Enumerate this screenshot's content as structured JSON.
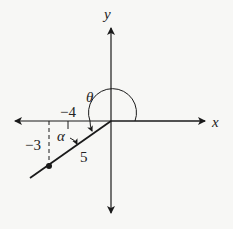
{
  "diagram": {
    "axes": {
      "x_label": "x",
      "y_label": "y"
    },
    "labels": {
      "theta": "θ",
      "alpha": "α",
      "x_coord": "−4",
      "y_coord": "−3",
      "hypotenuse": "5"
    },
    "point": {
      "x": -4,
      "y": -3
    },
    "colors": {
      "line": "#1a1a1a",
      "background": "#f7f7f5"
    }
  }
}
